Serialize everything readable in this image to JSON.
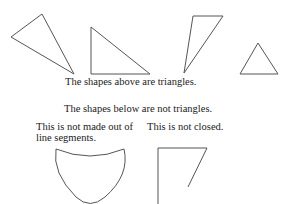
{
  "captions": {
    "above": "The shapes above are triangles.",
    "below": "The shapes below are not triangles.",
    "curved_line1": "This is not made out of",
    "curved_line2": "line segments.",
    "open": "This is not closed."
  },
  "colors": {
    "stroke": "#555555",
    "text": "#1a1a1a"
  }
}
